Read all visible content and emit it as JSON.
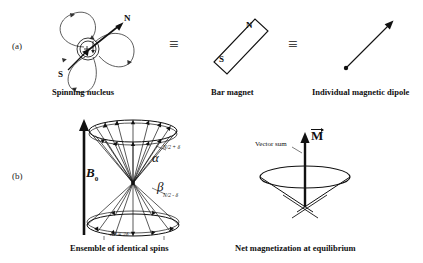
{
  "figure": {
    "title_panels": [
      "a",
      "b"
    ],
    "background": "#ffffff",
    "ink": "#111111"
  },
  "panel_a": {
    "tag": "(a)",
    "equivalence_symbol_1": "≡",
    "equivalence_symbol_2": "≡",
    "spinning_nucleus": {
      "caption": "Spinning nucleus",
      "pole_north": "N",
      "pole_south": "S",
      "nucleus_charge": "+",
      "icon": "spinning-nucleus-icon"
    },
    "bar_magnet": {
      "caption": "Bar magnet",
      "pole_north": "N",
      "pole_south": "S",
      "icon": "bar-magnet-icon"
    },
    "dipole": {
      "caption": "Individual magnetic dipole",
      "icon": "dipole-arrow-icon"
    }
  },
  "panel_b": {
    "tag": "(b)",
    "ensemble": {
      "caption": "Ensemble of identical spins",
      "field_label": "B",
      "field_subscript": "0",
      "alpha_label": "α",
      "beta_label": "β",
      "alpha_population": "N/2 + δ",
      "beta_population": "N/2 - δ",
      "population_difference": "ΔP = 2δ",
      "icon": "double-cone-spins-icon"
    },
    "net_magnetization": {
      "caption": "Net magnetization at equilibrium",
      "vector_sum_label": "Vector sum",
      "magnetization_label": "M",
      "icon": "magnetization-cone-icon"
    }
  }
}
